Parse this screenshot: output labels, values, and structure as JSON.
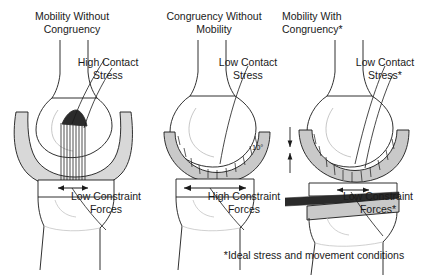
{
  "figure": {
    "caption_footnote": "*Ideal stress and movement conditions",
    "background_color": "#ffffff",
    "ink_color": "#1a1a1a",
    "implant_fill_color": "#d8d8d8",
    "bone_fill_color": "#ffffff",
    "bearing_fill_color": "#c9c9c9"
  },
  "panels": [
    {
      "id": "mobility-without-congruency",
      "title": "Mobility Without\nCongruency",
      "contact_label": "High Contact\nStress",
      "constraint_label": "Low Constraint\nForces",
      "motion_arrow": "short-double-headed",
      "contact_level": "high",
      "constraint_level": "low",
      "angle_label": null
    },
    {
      "id": "congruency-without-mobility",
      "title": "Congruency Without\nMobility",
      "contact_label": "Low Contact\nStress",
      "constraint_label": "High Constraint\nForces",
      "motion_arrow": "wide-double-headed",
      "contact_level": "low",
      "constraint_level": "high",
      "angle_label": null
    },
    {
      "id": "mobility-with-congruency",
      "title": "Mobility With\nCongruency*",
      "contact_label": "Low Contact\nStress*",
      "constraint_label": "Low Constraint\nForces*",
      "motion_arrow": "short-double-headed",
      "contact_level": "low",
      "constraint_level": "low",
      "angle_label": "10°"
    }
  ]
}
